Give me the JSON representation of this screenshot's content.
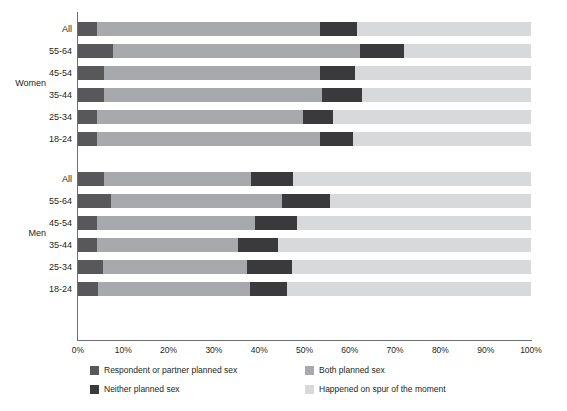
{
  "chart_data": {
    "type": "bar",
    "orientation": "horizontal",
    "stacked": true,
    "title": "",
    "xlabel": "",
    "ylabel": "",
    "xlim": [
      0,
      100
    ],
    "grid": true,
    "legend_position": "bottom",
    "xticks": [
      "0%",
      "10%",
      "20%",
      "30%",
      "40%",
      "50%",
      "60%",
      "70%",
      "80%",
      "90%",
      "100%"
    ],
    "xtick_values": [
      0,
      10,
      20,
      30,
      40,
      50,
      60,
      70,
      80,
      90,
      100
    ],
    "series": [
      {
        "name": "Respondent or partner planned sex",
        "color": "#58585b"
      },
      {
        "name": "Both planned sex",
        "color": "#a7a9ac"
      },
      {
        "name": "Neither planned sex",
        "color": "#3a3a3c"
      },
      {
        "name": "Happened on spur of the moment",
        "color": "#d8d9da"
      }
    ],
    "groups": [
      {
        "name": "Women",
        "categories": [
          "All",
          "55-64",
          "45-54",
          "35-44",
          "25-34",
          "18-24"
        ],
        "rows": [
          {
            "label": "All",
            "values": [
              4.2,
              49.2,
              8.2,
              38.4
            ]
          },
          {
            "label": "55-64",
            "values": [
              7.7,
              54.6,
              9.7,
              28.0
            ]
          },
          {
            "label": "45-54",
            "values": [
              5.7,
              47.7,
              7.8,
              38.8
            ]
          },
          {
            "label": "35-44",
            "values": [
              5.7,
              48.2,
              8.8,
              37.3
            ]
          },
          {
            "label": "25-34",
            "values": [
              4.2,
              45.5,
              6.6,
              43.7
            ]
          },
          {
            "label": "18-24",
            "values": [
              4.2,
              49.2,
              7.3,
              39.3
            ]
          }
        ]
      },
      {
        "name": "Men",
        "categories": [
          "All",
          "55-64",
          "45-54",
          "35-44",
          "25-34",
          "18-24"
        ],
        "rows": [
          {
            "label": "All",
            "values": [
              5.7,
              32.5,
              9.3,
              52.5
            ]
          },
          {
            "label": "55-64",
            "values": [
              7.3,
              37.7,
              10.6,
              44.4
            ]
          },
          {
            "label": "45-54",
            "values": [
              4.2,
              34.9,
              9.2,
              51.7
            ]
          },
          {
            "label": "35-44",
            "values": [
              4.2,
              31.1,
              8.9,
              55.8
            ]
          },
          {
            "label": "25-34",
            "values": [
              5.5,
              31.8,
              9.9,
              52.8
            ]
          },
          {
            "label": "18-24",
            "values": [
              4.4,
              33.6,
              8.1,
              53.9
            ]
          }
        ]
      }
    ]
  },
  "legend": {
    "items": [
      {
        "label": "Respondent or partner planned sex",
        "swatch": "sw0"
      },
      {
        "label": "Both planned sex",
        "swatch": "sw1"
      },
      {
        "label": "Neither planned sex",
        "swatch": "sw2"
      },
      {
        "label": "Happened on spur of the moment",
        "swatch": "sw3"
      }
    ]
  },
  "colors": {
    "respondent_or_partner": "#58585b",
    "both_planned": "#a7a9ac",
    "neither_planned": "#3a3a3c",
    "spur_of_moment": "#d8d9da",
    "axis": "#6d6e71",
    "text": "#231f20",
    "background": "#ffffff"
  }
}
